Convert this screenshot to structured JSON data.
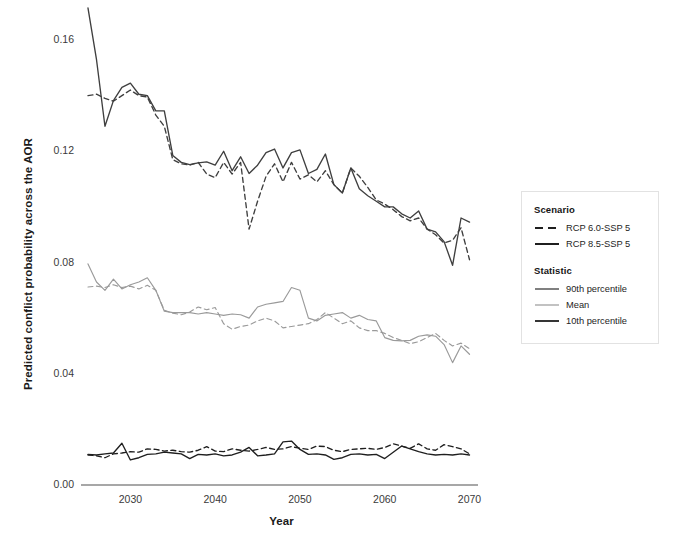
{
  "chart_data": {
    "type": "line",
    "title": "",
    "xlabel": "Year",
    "ylabel": "Predicted conflict probability across the AOR",
    "xlim": [
      2025,
      2071
    ],
    "ylim": [
      0.0,
      0.172
    ],
    "xticks": [
      2030,
      2040,
      2050,
      2060,
      2070
    ],
    "yticks": [
      0.0,
      0.04,
      0.08,
      0.12,
      0.16
    ],
    "ytick_labels": [
      "0.00",
      "0.04",
      "0.08",
      "0.12",
      "0.16"
    ],
    "xtick_labels": [
      "2030",
      "2040",
      "2050",
      "2060",
      "2070"
    ],
    "grid": false,
    "legend_position": "right-outside",
    "x": [
      2025,
      2026,
      2027,
      2028,
      2029,
      2030,
      2031,
      2032,
      2033,
      2034,
      2035,
      2036,
      2037,
      2038,
      2039,
      2040,
      2041,
      2042,
      2043,
      2044,
      2045,
      2046,
      2047,
      2048,
      2049,
      2050,
      2051,
      2052,
      2053,
      2054,
      2055,
      2056,
      2057,
      2058,
      2059,
      2060,
      2061,
      2062,
      2063,
      2064,
      2065,
      2066,
      2067,
      2068,
      2069,
      2070
    ],
    "series": [
      {
        "name": "RCP 8.5-SSP 5 — 90th percentile",
        "scenario": "RCP 8.5-SSP 5",
        "statistic": "90th percentile",
        "style": "solid",
        "color": "#3f3f3f",
        "values": [
          0.1715,
          0.153,
          0.129,
          0.1382,
          0.143,
          0.1445,
          0.1405,
          0.14,
          0.1345,
          0.1345,
          0.1185,
          0.116,
          0.1152,
          0.1158,
          0.1162,
          0.115,
          0.12,
          0.113,
          0.118,
          0.112,
          0.115,
          0.1195,
          0.1208,
          0.114,
          0.1195,
          0.1205,
          0.112,
          0.1135,
          0.119,
          0.108,
          0.105,
          0.114,
          0.1065,
          0.104,
          0.102,
          0.1,
          0.1,
          0.0975,
          0.096,
          0.0985,
          0.092,
          0.091,
          0.0875,
          0.079,
          0.096,
          0.0945
        ]
      },
      {
        "name": "RCP 6.0-SSP 5 — 90th percentile",
        "scenario": "RCP 6.0-SSP 5",
        "statistic": "90th percentile",
        "style": "dashed",
        "color": "#3f3f3f",
        "values": [
          0.14,
          0.1405,
          0.139,
          0.138,
          0.14,
          0.142,
          0.14,
          0.1395,
          0.133,
          0.129,
          0.117,
          0.1155,
          0.115,
          0.116,
          0.1118,
          0.1105,
          0.116,
          0.1118,
          0.116,
          0.092,
          0.102,
          0.111,
          0.1155,
          0.109,
          0.116,
          0.11,
          0.1115,
          0.109,
          0.113,
          0.108,
          0.105,
          0.114,
          0.111,
          0.107,
          0.1025,
          0.101,
          0.099,
          0.0965,
          0.095,
          0.096,
          0.092,
          0.09,
          0.087,
          0.088,
          0.0925,
          0.081
        ]
      },
      {
        "name": "RCP 8.5-SSP 5 — Mean",
        "scenario": "RCP 8.5-SSP 5",
        "statistic": "Mean",
        "style": "solid",
        "color": "#9a9a9a",
        "values": [
          0.0795,
          0.073,
          0.07,
          0.074,
          0.0705,
          0.072,
          0.073,
          0.0745,
          0.07,
          0.0625,
          0.062,
          0.062,
          0.062,
          0.0615,
          0.062,
          0.0615,
          0.061,
          0.0615,
          0.0612,
          0.06,
          0.064,
          0.065,
          0.0655,
          0.066,
          0.071,
          0.07,
          0.06,
          0.059,
          0.061,
          0.0615,
          0.062,
          0.06,
          0.061,
          0.0595,
          0.059,
          0.053,
          0.052,
          0.0518,
          0.052,
          0.0535,
          0.054,
          0.0535,
          0.0505,
          0.044,
          0.05,
          0.047
        ]
      },
      {
        "name": "RCP 6.0-SSP 5 — Mean",
        "scenario": "RCP 6.0-SSP 5",
        "statistic": "Mean",
        "style": "dashed",
        "color": "#9a9a9a",
        "values": [
          0.0712,
          0.0715,
          0.071,
          0.072,
          0.071,
          0.0715,
          0.0705,
          0.0718,
          0.07,
          0.0628,
          0.0618,
          0.0612,
          0.0622,
          0.064,
          0.063,
          0.0638,
          0.058,
          0.056,
          0.057,
          0.0575,
          0.059,
          0.06,
          0.059,
          0.0565,
          0.057,
          0.0575,
          0.058,
          0.0595,
          0.062,
          0.06,
          0.058,
          0.059,
          0.0565,
          0.0555,
          0.0555,
          0.0545,
          0.053,
          0.052,
          0.0508,
          0.0515,
          0.053,
          0.0545,
          0.052,
          0.05,
          0.051,
          0.049
        ]
      },
      {
        "name": "RCP 8.5-SSP 5 — 10th percentile",
        "scenario": "RCP 8.5-SSP 5",
        "statistic": "10th percentile",
        "style": "solid",
        "color": "#1f1f1f",
        "values": [
          0.011,
          0.0108,
          0.0112,
          0.0115,
          0.015,
          0.009,
          0.0098,
          0.011,
          0.0112,
          0.0118,
          0.0115,
          0.0112,
          0.0095,
          0.011,
          0.0108,
          0.0112,
          0.0105,
          0.0108,
          0.0118,
          0.0135,
          0.0105,
          0.0108,
          0.0112,
          0.0155,
          0.0158,
          0.0128,
          0.011,
          0.0112,
          0.0108,
          0.0092,
          0.0098,
          0.011,
          0.0112,
          0.0108,
          0.011,
          0.0095,
          0.0118,
          0.014,
          0.013,
          0.012,
          0.0112,
          0.0108,
          0.011,
          0.0108,
          0.0112,
          0.0108
        ]
      },
      {
        "name": "RCP 6.0-SSP 5 — 10th percentile",
        "scenario": "RCP 6.0-SSP 5",
        "statistic": "10th percentile",
        "style": "dashed",
        "color": "#1f1f1f",
        "values": [
          0.0108,
          0.0105,
          0.0098,
          0.0112,
          0.0115,
          0.012,
          0.0118,
          0.013,
          0.0128,
          0.0122,
          0.0125,
          0.012,
          0.0118,
          0.0125,
          0.0138,
          0.0122,
          0.012,
          0.013,
          0.0125,
          0.0122,
          0.0128,
          0.0135,
          0.0128,
          0.013,
          0.0138,
          0.0132,
          0.0128,
          0.014,
          0.0138,
          0.0125,
          0.012,
          0.0128,
          0.013,
          0.0132,
          0.0128,
          0.0135,
          0.0148,
          0.014,
          0.0132,
          0.0148,
          0.013,
          0.0125,
          0.0145,
          0.0138,
          0.013,
          0.0112
        ]
      }
    ]
  },
  "legend": {
    "scenario_title": "Scenario",
    "scenario_items": [
      {
        "label": "RCP 6.0-SSP 5",
        "style": "dashed",
        "color": "#1f1f1f"
      },
      {
        "label": "RCP 8.5-SSP 5",
        "style": "solid",
        "color": "#1f1f1f"
      }
    ],
    "statistic_title": "Statistic",
    "statistic_items": [
      {
        "label": "90th percentile",
        "style": "solid",
        "color": "#4a4a4a"
      },
      {
        "label": "Mean",
        "style": "solid",
        "color": "#a8a8a8"
      },
      {
        "label": "10th percentile",
        "style": "solid",
        "color": "#1f1f1f"
      }
    ]
  },
  "axis": {
    "x_title": "Year",
    "y_title": "Predicted conflict probability across the AOR"
  }
}
